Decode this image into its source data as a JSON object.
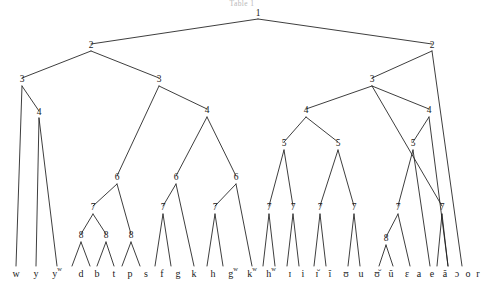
{
  "figure": {
    "caption": "Table 1"
  },
  "chart_data": {
    "type": "diagram",
    "title": "Table 1",
    "subtype": "hierarchical-tree",
    "levels": [
      1,
      2,
      3,
      4,
      5,
      6,
      7,
      8
    ],
    "nodes": [
      {
        "id": "n1",
        "label": "1",
        "x": 258,
        "y": 16,
        "level": 1
      },
      {
        "id": "n2L",
        "label": "2",
        "x": 91,
        "y": 48,
        "level": 2
      },
      {
        "id": "n2R",
        "label": "2",
        "x": 432,
        "y": 48,
        "level": 2
      },
      {
        "id": "n3a",
        "label": "3",
        "x": 22,
        "y": 82,
        "level": 3
      },
      {
        "id": "n3b",
        "label": "3",
        "x": 159,
        "y": 82,
        "level": 3
      },
      {
        "id": "n3c",
        "label": "3",
        "x": 372,
        "y": 82,
        "level": 3
      },
      {
        "id": "n4a",
        "label": "4",
        "x": 39,
        "y": 115,
        "level": 4
      },
      {
        "id": "n4b",
        "label": "4",
        "x": 207,
        "y": 113,
        "level": 4
      },
      {
        "id": "n4c",
        "label": "4",
        "x": 306,
        "y": 113,
        "level": 4
      },
      {
        "id": "n4d",
        "label": "4",
        "x": 429,
        "y": 113,
        "level": 4
      },
      {
        "id": "n5a",
        "label": "5",
        "x": 284,
        "y": 146,
        "level": 5
      },
      {
        "id": "n5b",
        "label": "5",
        "x": 338,
        "y": 146,
        "level": 5
      },
      {
        "id": "n5c",
        "label": "5",
        "x": 413,
        "y": 146,
        "level": 5
      },
      {
        "id": "n6a",
        "label": "6",
        "x": 117,
        "y": 180,
        "level": 6
      },
      {
        "id": "n6b",
        "label": "6",
        "x": 176,
        "y": 180,
        "level": 6
      },
      {
        "id": "n6c",
        "label": "6",
        "x": 236,
        "y": 180,
        "level": 6
      },
      {
        "id": "n7a",
        "label": "7",
        "x": 93,
        "y": 210,
        "level": 7
      },
      {
        "id": "n7b",
        "label": "7",
        "x": 163,
        "y": 210,
        "level": 7
      },
      {
        "id": "n7c",
        "label": "7",
        "x": 215,
        "y": 210,
        "level": 7
      },
      {
        "id": "n7d",
        "label": "7",
        "x": 269,
        "y": 210,
        "level": 7
      },
      {
        "id": "n7e",
        "label": "7",
        "x": 293,
        "y": 210,
        "level": 7
      },
      {
        "id": "n7f",
        "label": "7",
        "x": 320,
        "y": 210,
        "level": 7
      },
      {
        "id": "n7g",
        "label": "7",
        "x": 354,
        "y": 210,
        "level": 7
      },
      {
        "id": "n7h",
        "label": "7",
        "x": 398,
        "y": 210,
        "level": 7
      },
      {
        "id": "n7i",
        "label": "7",
        "x": 442,
        "y": 210,
        "level": 7
      },
      {
        "id": "n8a",
        "label": "8",
        "x": 81,
        "y": 238,
        "level": 8
      },
      {
        "id": "n8b",
        "label": "8",
        "x": 106,
        "y": 238,
        "level": 8
      },
      {
        "id": "n8c",
        "label": "8",
        "x": 131,
        "y": 238,
        "level": 8
      },
      {
        "id": "n8d",
        "label": "8",
        "x": 386,
        "y": 241,
        "level": 8
      }
    ],
    "leaves": [
      {
        "base": "w",
        "sup": "",
        "x": 16
      },
      {
        "base": "y",
        "sup": "",
        "x": 36
      },
      {
        "base": "y",
        "sup": "w",
        "x": 57
      },
      {
        "base": "d",
        "sup": "",
        "x": 81
      },
      {
        "base": "b",
        "sup": "",
        "x": 97
      },
      {
        "base": "t",
        "sup": "",
        "x": 114
      },
      {
        "base": "p",
        "sup": "",
        "x": 130
      },
      {
        "base": "s",
        "sup": "",
        "x": 146
      },
      {
        "base": "f",
        "sup": "",
        "x": 162
      },
      {
        "base": "g",
        "sup": "",
        "x": 178
      },
      {
        "base": "k",
        "sup": "",
        "x": 194
      },
      {
        "base": "h",
        "sup": "",
        "x": 213
      },
      {
        "base": "g",
        "sup": "w",
        "x": 233
      },
      {
        "base": "k",
        "sup": "w",
        "x": 252
      },
      {
        "base": "h",
        "sup": "w",
        "x": 271
      },
      {
        "base": "ɪ",
        "sup": "",
        "x": 290
      },
      {
        "base": "i",
        "sup": "",
        "x": 303
      },
      {
        "base": "ɪ̆",
        "sup": "",
        "x": 317
      },
      {
        "base": "ĭ",
        "sup": "",
        "x": 330
      },
      {
        "base": "ʊ",
        "sup": "",
        "x": 346
      },
      {
        "base": "u",
        "sup": "",
        "x": 361
      },
      {
        "base": "ʊ̆",
        "sup": "",
        "x": 377
      },
      {
        "base": "ŭ",
        "sup": "",
        "x": 391
      },
      {
        "base": "ɛ",
        "sup": "",
        "x": 407
      },
      {
        "base": "a",
        "sup": "",
        "x": 419
      },
      {
        "base": "e",
        "sup": "",
        "x": 432
      },
      {
        "base": "ă",
        "sup": "",
        "x": 445
      },
      {
        "base": "ɔ",
        "sup": "",
        "x": 457
      },
      {
        "base": "o",
        "sup": "",
        "x": 468
      },
      {
        "base": "r",
        "sup": "",
        "x": 478
      }
    ],
    "edges": [
      [
        258,
        19,
        91,
        44
      ],
      [
        258,
        19,
        432,
        44
      ],
      [
        91,
        51,
        22,
        78
      ],
      [
        91,
        51,
        159,
        78
      ],
      [
        432,
        51,
        372,
        78
      ],
      [
        432,
        51,
        462,
        266
      ],
      [
        22,
        86,
        16,
        266
      ],
      [
        22,
        86,
        39,
        111
      ],
      [
        39,
        118,
        36,
        266
      ],
      [
        39,
        118,
        57,
        266
      ],
      [
        159,
        86,
        117,
        176
      ],
      [
        159,
        86,
        207,
        109
      ],
      [
        117,
        184,
        93,
        206
      ],
      [
        117,
        184,
        131,
        234
      ],
      [
        93,
        214,
        81,
        234
      ],
      [
        93,
        214,
        106,
        234
      ],
      [
        81,
        242,
        72,
        266
      ],
      [
        81,
        242,
        90,
        266
      ],
      [
        106,
        242,
        97,
        266
      ],
      [
        106,
        242,
        114,
        266
      ],
      [
        131,
        242,
        122,
        266
      ],
      [
        131,
        242,
        140,
        266
      ],
      [
        207,
        117,
        176,
        176
      ],
      [
        207,
        117,
        236,
        176
      ],
      [
        176,
        184,
        163,
        206
      ],
      [
        176,
        184,
        194,
        266
      ],
      [
        163,
        214,
        155,
        266
      ],
      [
        163,
        214,
        171,
        266
      ],
      [
        236,
        184,
        215,
        206
      ],
      [
        236,
        184,
        252,
        266
      ],
      [
        215,
        214,
        207,
        266
      ],
      [
        215,
        214,
        223,
        266
      ],
      [
        372,
        86,
        306,
        109
      ],
      [
        372,
        86,
        429,
        109
      ],
      [
        306,
        117,
        284,
        142
      ],
      [
        306,
        117,
        338,
        142
      ],
      [
        284,
        150,
        269,
        206
      ],
      [
        284,
        150,
        293,
        206
      ],
      [
        338,
        150,
        320,
        206
      ],
      [
        338,
        150,
        354,
        206
      ],
      [
        269,
        214,
        263,
        266
      ],
      [
        269,
        214,
        275,
        266
      ],
      [
        293,
        214,
        287,
        266
      ],
      [
        293,
        214,
        299,
        266
      ],
      [
        320,
        214,
        314,
        266
      ],
      [
        320,
        214,
        326,
        266
      ],
      [
        354,
        214,
        348,
        266
      ],
      [
        354,
        214,
        360,
        266
      ],
      [
        429,
        117,
        413,
        142
      ],
      [
        429,
        117,
        448,
        266
      ],
      [
        413,
        150,
        398,
        206
      ],
      [
        413,
        150,
        430,
        266
      ],
      [
        398,
        214,
        386,
        237
      ],
      [
        398,
        214,
        410,
        266
      ],
      [
        386,
        245,
        379,
        266
      ],
      [
        386,
        245,
        393,
        266
      ],
      [
        442,
        214,
        437,
        266
      ],
      [
        442,
        214,
        448,
        266
      ],
      [
        372,
        86,
        442,
        206
      ]
    ]
  }
}
